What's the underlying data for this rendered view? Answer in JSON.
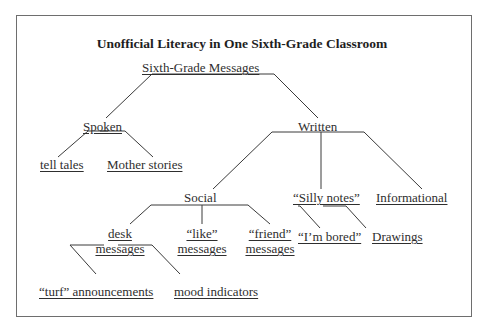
{
  "diagram": {
    "title": "Unofficial Literacy in One Sixth-Grade Classroom",
    "nodes": {
      "root": "Sixth-Grade Messages",
      "spoken": "Spoken",
      "written": "Written",
      "tell_tales": "tell tales",
      "mother_stories": "Mother stories",
      "social": "Social",
      "silly_notes": "“Silly notes”",
      "informational": "Informational",
      "desk_messages_1": "desk",
      "desk_messages_2": "messages",
      "like_messages_1": "“like”",
      "like_messages_2": "messages",
      "friend_messages_1": "“friend”",
      "friend_messages_2": "messages",
      "im_bored": "“I’m bored”",
      "drawings": "Drawings",
      "turf_announcements": "“turf” announcements",
      "mood_indicators": "mood indicators"
    },
    "edges": [
      [
        "Sixth-Grade Messages",
        "Spoken"
      ],
      [
        "Sixth-Grade Messages",
        "Written"
      ],
      [
        "Spoken",
        "tell tales"
      ],
      [
        "Spoken",
        "Mother stories"
      ],
      [
        "Written",
        "Social"
      ],
      [
        "Written",
        "Silly notes"
      ],
      [
        "Written",
        "Informational"
      ],
      [
        "Social",
        "desk messages"
      ],
      [
        "Social",
        "like messages"
      ],
      [
        "Social",
        "friend messages"
      ],
      [
        "Silly notes",
        "I'm bored"
      ],
      [
        "Silly notes",
        "Drawings"
      ],
      [
        "desk messages",
        "turf announcements"
      ],
      [
        "desk messages",
        "mood indicators"
      ]
    ]
  }
}
